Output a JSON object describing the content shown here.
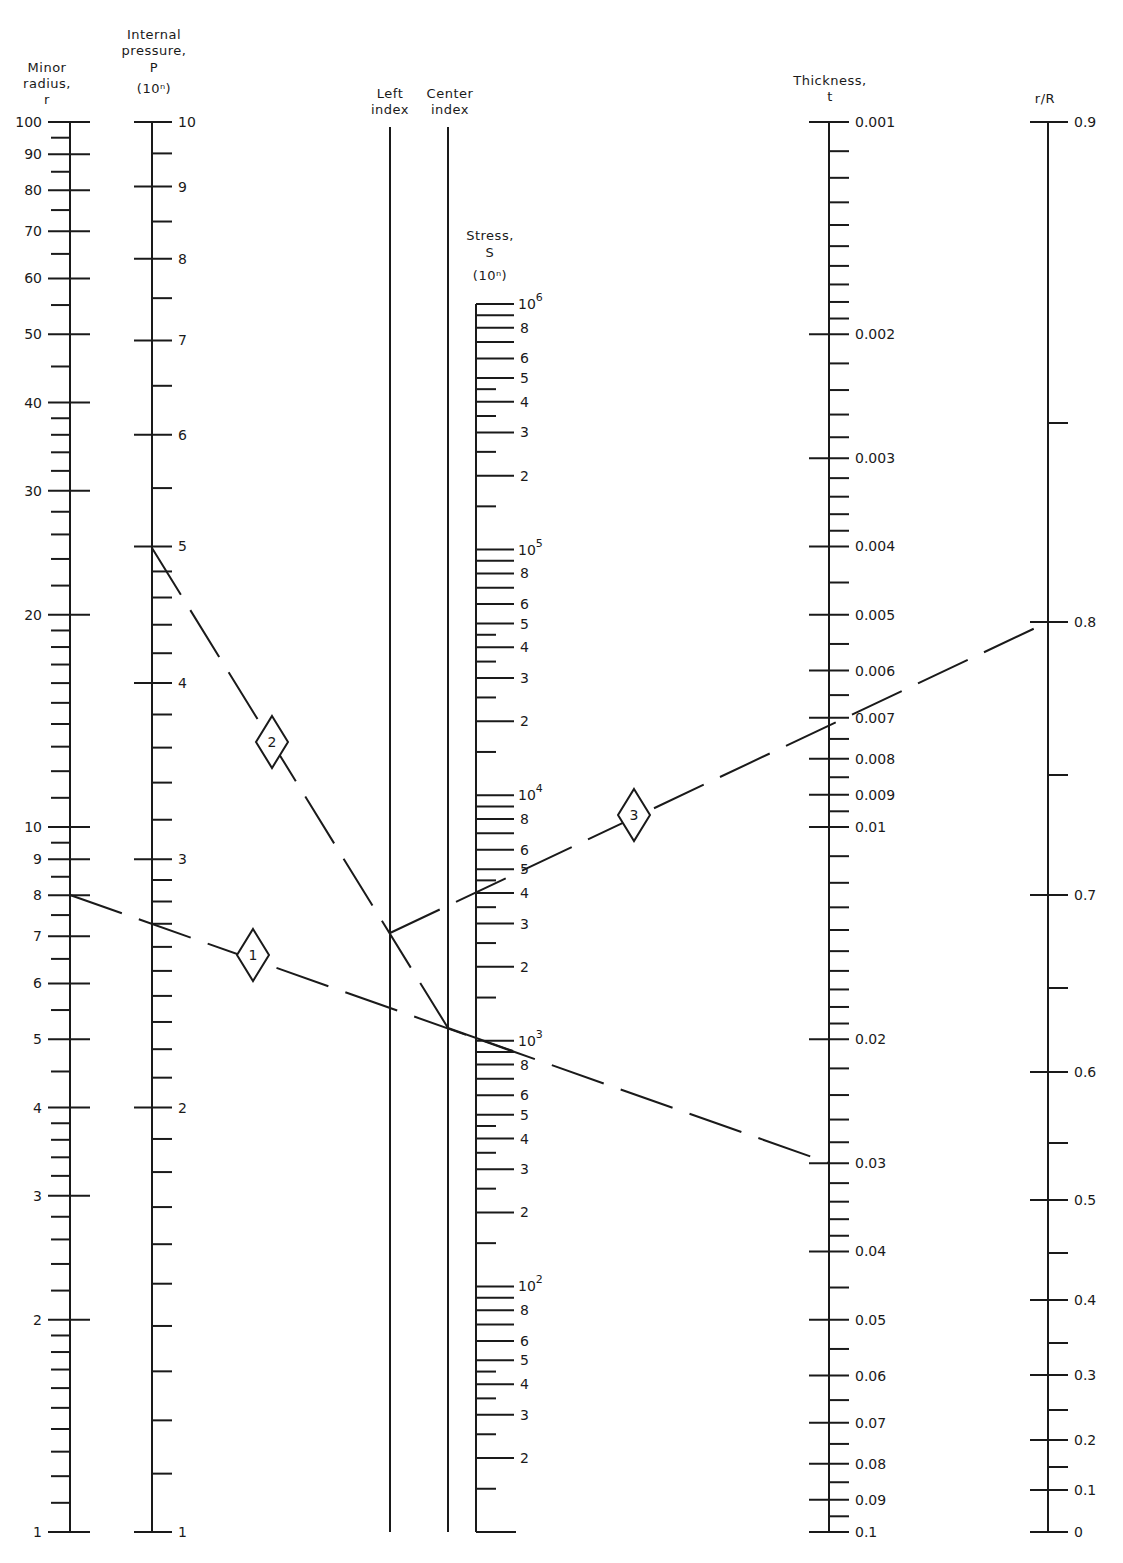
{
  "chart_data": {
    "type": "nomogram",
    "title": "",
    "axes": [
      {
        "id": "minor_radius",
        "title_lines": [
          "Minor",
          "radius,",
          "r"
        ],
        "scale": "log",
        "range": [
          1,
          100
        ],
        "x": 70,
        "y_at_min": 1532,
        "y_at_max": 122,
        "label_side": "left",
        "major_labels": [
          100,
          90,
          80,
          70,
          60,
          50,
          40,
          30,
          20,
          10,
          9,
          8,
          7,
          6,
          5,
          4,
          3,
          2,
          1
        ],
        "minor_ticks": [
          95,
          85,
          75,
          65,
          55,
          45,
          38,
          36,
          34,
          32,
          28,
          26,
          24,
          22,
          19,
          18,
          17,
          16,
          15,
          14,
          13,
          12,
          11,
          9.5,
          8.5,
          7.5,
          6.5,
          5.5,
          4.5,
          3.8,
          3.6,
          3.4,
          3.2,
          2.8,
          2.6,
          2.4,
          2.2,
          1.9,
          1.8,
          1.7,
          1.6,
          1.5,
          1.4,
          1.3,
          1.2,
          1.1
        ]
      },
      {
        "id": "internal_pressure",
        "title_lines": [
          "Internal",
          "pressure,",
          "P",
          "(10ⁿ)"
        ],
        "scale": "log",
        "range": [
          1,
          10
        ],
        "x": 152,
        "y_at_min": 1532,
        "y_at_max": 122,
        "label_side": "right",
        "major_labels": [
          10,
          9,
          8,
          7,
          6,
          5,
          4,
          3,
          2,
          1
        ],
        "minor_ticks": [
          9.5,
          8.5,
          7.5,
          6.5,
          5.5,
          4.8,
          4.6,
          4.4,
          4.2,
          3.8,
          3.6,
          3.4,
          3.2,
          2.9,
          2.8,
          2.7,
          2.6,
          2.5,
          2.4,
          2.3,
          2.2,
          2.1,
          1.9,
          1.8,
          1.7,
          1.6,
          1.5,
          1.4,
          1.3,
          1.2,
          1.1
        ]
      },
      {
        "id": "left_index",
        "title_lines": [
          "Left",
          "index"
        ],
        "scale": "none",
        "x": 390,
        "y_top": 127,
        "y_bottom": 1532
      },
      {
        "id": "center_index",
        "title_lines": [
          "Center",
          "index"
        ],
        "scale": "none",
        "x": 448,
        "y_top": 127,
        "y_bottom": 1532
      },
      {
        "id": "stress",
        "title_lines": [
          "Stress,",
          "S",
          "(10ⁿ)"
        ],
        "scale": "log",
        "range": [
          10,
          1000000
        ],
        "x": 476,
        "y_at_min": 1532,
        "y_at_max": 304,
        "label_side": "right",
        "decade_labels": [
          {
            "base": "10",
            "exp": "6",
            "value": 1000000
          },
          {
            "base": "10",
            "exp": "5",
            "value": 100000
          },
          {
            "base": "10",
            "exp": "4",
            "value": 10000
          },
          {
            "base": "10",
            "exp": "3",
            "value": 1000
          },
          {
            "base": "10",
            "exp": "2",
            "value": 100
          }
        ],
        "mantissa_labels": [
          8,
          6,
          5,
          4,
          3,
          2
        ],
        "mantissa_long_unlabeled": [
          9,
          7
        ],
        "mantissa_short": [
          4.5,
          3.5,
          2.5,
          1.5
        ]
      },
      {
        "id": "thickness",
        "title_lines": [
          "Thickness,",
          "t"
        ],
        "scale": "log",
        "range": [
          0.001,
          0.1
        ],
        "x": 829,
        "y_at_min": 122,
        "y_at_max": 1532,
        "label_side": "right",
        "major_labels": [
          "0.001",
          "0.002",
          "0.003",
          "0.004",
          "0.005",
          "0.006",
          "0.007",
          "0.008",
          "0.009",
          "0.01",
          "0.02",
          "0.03",
          "0.04",
          "0.05",
          "0.06",
          "0.07",
          "0.08",
          "0.09",
          "0.1"
        ],
        "minor_ticks": [
          0.0011,
          0.0012,
          0.0013,
          0.0014,
          0.0015,
          0.0016,
          0.0017,
          0.0018,
          0.0019,
          0.0022,
          0.0024,
          0.0026,
          0.0028,
          0.0032,
          0.0034,
          0.0036,
          0.0038,
          0.0045,
          0.0055,
          0.0065,
          0.0075,
          0.0085,
          0.0095,
          0.011,
          0.012,
          0.013,
          0.014,
          0.015,
          0.016,
          0.017,
          0.018,
          0.019,
          0.022,
          0.024,
          0.026,
          0.028,
          0.032,
          0.034,
          0.036,
          0.038,
          0.045,
          0.055,
          0.065,
          0.075,
          0.085,
          0.095
        ]
      },
      {
        "id": "r_over_R",
        "title_lines": [
          "r/R"
        ],
        "scale": "nonlinear",
        "range": [
          0,
          0.9
        ],
        "x": 1048,
        "label_side": "right",
        "major_labels": [
          {
            "label": "0.9",
            "y": 122
          },
          {
            "label": "0.8",
            "y": 622
          },
          {
            "label": "0.7",
            "y": 895
          },
          {
            "label": "0.6",
            "y": 1072
          },
          {
            "label": "0.5",
            "y": 1200
          },
          {
            "label": "0.4",
            "y": 1300
          },
          {
            "label": "0.3",
            "y": 1375
          },
          {
            "label": "0.2",
            "y": 1440
          },
          {
            "label": "0.1",
            "y": 1490
          },
          {
            "label": "0",
            "y": 1532
          }
        ],
        "minor_ticks_y": [
          423,
          775,
          988,
          1143,
          1253,
          1343,
          1410,
          1467
        ]
      }
    ],
    "construction_lines": [
      {
        "step": "1",
        "from": {
          "axis": "r",
          "value": 8
        },
        "to": {
          "axis": "t",
          "value": 0.03
        },
        "points": [
          [
            70,
            895
          ],
          [
            829,
            1163
          ]
        ],
        "style": "dashed",
        "marker": {
          "label": "1",
          "x": 253,
          "y": 955
        }
      },
      {
        "step": "2",
        "from": {
          "axis": "P",
          "value": 5
        },
        "to": {
          "axis": "center_index"
        },
        "points": [
          [
            152,
            548
          ],
          [
            448,
            1028
          ]
        ],
        "style": "dashed",
        "marker": {
          "label": "2",
          "x": 272,
          "y": 742
        }
      },
      {
        "step": "3",
        "from": {
          "axis": "left_index"
        },
        "to": {
          "axis": "r/R",
          "value": 0.8
        },
        "points": [
          [
            390,
            933
          ],
          [
            1048,
            622
          ]
        ],
        "style": "dashed",
        "marker": {
          "label": "3",
          "x": 634,
          "y": 815
        }
      },
      {
        "step": "result",
        "from": {
          "axis": "center_index"
        },
        "to": {
          "axis": "S",
          "value": 900
        },
        "points": [
          [
            448,
            1028
          ],
          [
            513,
            1051
          ]
        ],
        "style": "solid"
      }
    ],
    "reading": {
      "r": 8,
      "t": 0.03,
      "P": 5,
      "r_over_R": 0.8,
      "t_result": 0.007,
      "S_result_approx": 900
    }
  }
}
